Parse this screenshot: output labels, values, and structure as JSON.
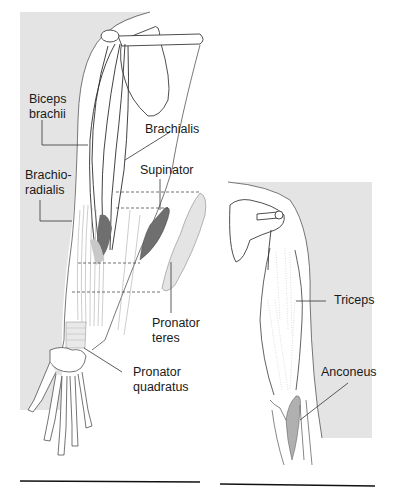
{
  "figure": {
    "left_panel": {
      "view": "anterior arm and forearm",
      "labels": [
        {
          "id": "biceps",
          "text": "Biceps\nbrachii"
        },
        {
          "id": "brachialis",
          "text": "Brachialis"
        },
        {
          "id": "brachioradialis",
          "text": "Brachio-\nradialis"
        },
        {
          "id": "supinator",
          "text": "Supinator"
        },
        {
          "id": "pronator_teres",
          "text": "Pronator\nteres"
        },
        {
          "id": "pronator_quadratus",
          "text": "Pronator\nquadratus"
        }
      ]
    },
    "right_panel": {
      "view": "posterior arm",
      "labels": [
        {
          "id": "triceps",
          "text": "Triceps"
        },
        {
          "id": "anconeus",
          "text": "Anconeus"
        }
      ]
    },
    "colors": {
      "background_shade": "#e4e4e4",
      "outline": "#3a3a3a",
      "muscle_dark": "#6f6f6f",
      "muscle_light": "#d2d2d2",
      "rule": "#111111"
    }
  }
}
